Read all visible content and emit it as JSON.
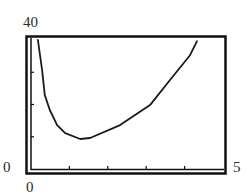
{
  "chart_data": {
    "type": "line",
    "title": "",
    "xlabel": "",
    "ylabel": "",
    "xlim": [
      0,
      5
    ],
    "ylim": [
      0,
      40
    ],
    "x_tick_labels": [
      "0",
      "5"
    ],
    "y_tick_labels": [
      "0",
      "40"
    ],
    "x_ticks": [
      1,
      2,
      3,
      4
    ],
    "y_ticks": [
      10,
      20,
      30
    ],
    "grid": false,
    "legend": null,
    "series": [
      {
        "name": "curve",
        "x": [
          0.18,
          0.29,
          0.36,
          0.49,
          0.68,
          0.89,
          1.28,
          1.54,
          2.32,
          3.1,
          3.62,
          4.14,
          4.32
        ],
        "y": [
          40,
          30.7,
          22.9,
          18.3,
          13.6,
          11.1,
          9.3,
          9.6,
          13.6,
          19.8,
          27.6,
          35.3,
          39.6
        ]
      }
    ]
  },
  "labels": {
    "ymax": "40",
    "ymin": "0",
    "xmin": "0",
    "xmax": "5"
  },
  "colors": {
    "line": "#1a1a1a",
    "frame": "#111111",
    "background": "#ffffff"
  }
}
